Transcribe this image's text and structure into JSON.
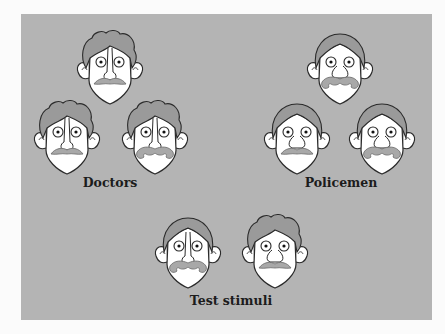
{
  "figure": {
    "background_color": "#b4b4b4",
    "groups": [
      {
        "label": "Doctors",
        "faces": [
          {
            "id": "doctor-1",
            "hair": "curly",
            "mustache": "plain"
          },
          {
            "id": "doctor-2",
            "hair": "curly",
            "mustache": "plain"
          },
          {
            "id": "doctor-3",
            "hair": "curly",
            "mustache": "curled"
          }
        ]
      },
      {
        "label": "Policemen",
        "faces": [
          {
            "id": "policeman-1",
            "hair": "smooth",
            "mustache": "curled"
          },
          {
            "id": "policeman-2",
            "hair": "smooth",
            "mustache": "plain"
          },
          {
            "id": "policeman-3",
            "hair": "smooth",
            "mustache": "curled"
          }
        ]
      },
      {
        "label": "Test stimuli",
        "faces": [
          {
            "id": "test-1",
            "hair": "smooth",
            "mustache": "curled"
          },
          {
            "id": "test-2",
            "hair": "curly",
            "mustache": "plain"
          }
        ]
      }
    ],
    "colors": {
      "hair": "#9a9a9a",
      "skin": "#ffffff",
      "mustache": "#a8a8a8",
      "outline": "#2a2a2a"
    }
  }
}
